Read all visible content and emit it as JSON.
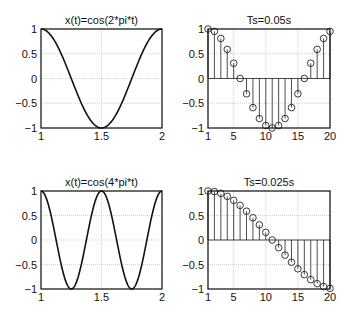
{
  "chart_data": [
    {
      "type": "line",
      "title": "x(t)=cos(2*pi*t)",
      "xlabel": "",
      "ylabel": "",
      "xlim": [
        1,
        2
      ],
      "ylim": [
        -1,
        1
      ],
      "xticks": [
        "1",
        "1.5",
        "2"
      ],
      "yticks": [
        "1",
        "0.5",
        "0",
        "−0.5",
        "−1"
      ],
      "grid": true,
      "function": "cos(2*pi*t)",
      "freq": 2
    },
    {
      "type": "stem",
      "title": "Ts=0.05s",
      "xlim": [
        1,
        20
      ],
      "ylim": [
        -1,
        1
      ],
      "xticks": [
        "1",
        "5",
        "10",
        "15",
        "20"
      ],
      "yticks": [
        "1",
        "0.5",
        "0",
        "−0.5",
        "−1"
      ],
      "grid": true,
      "x": [
        1,
        2,
        3,
        4,
        5,
        6,
        7,
        8,
        9,
        10,
        11,
        12,
        13,
        14,
        15,
        16,
        17,
        18,
        19,
        20
      ],
      "values": [
        1.0,
        0.951,
        0.809,
        0.588,
        0.309,
        0.0,
        -0.309,
        -0.588,
        -0.809,
        -0.951,
        -1.0,
        -0.951,
        -0.809,
        -0.588,
        -0.309,
        0.0,
        0.309,
        0.588,
        0.809,
        0.951
      ],
      "Ts": 0.05
    },
    {
      "type": "line",
      "title": "x(t)=cos(4*pi*t)",
      "xlim": [
        1,
        2
      ],
      "ylim": [
        -1,
        1
      ],
      "xticks": [
        "1",
        "1.5",
        "2"
      ],
      "yticks": [
        "1",
        "0.5",
        "0",
        "−0.5",
        "−1"
      ],
      "grid": true,
      "function": "cos(4*pi*t)",
      "freq": 4
    },
    {
      "type": "stem",
      "title": "Ts=0.025s",
      "xlim": [
        1,
        20
      ],
      "ylim": [
        -1,
        1
      ],
      "xticks": [
        "1",
        "5",
        "10",
        "15",
        "20"
      ],
      "yticks": [
        "1",
        "0.5",
        "0",
        "−0.5",
        "−1"
      ],
      "grid": true,
      "x": [
        1,
        2,
        3,
        4,
        5,
        6,
        7,
        8,
        9,
        10,
        11,
        12,
        13,
        14,
        15,
        16,
        17,
        18,
        19,
        20
      ],
      "values": [
        1.0,
        0.988,
        0.951,
        0.891,
        0.809,
        0.707,
        0.588,
        0.454,
        0.309,
        0.156,
        0.0,
        -0.156,
        -0.309,
        -0.454,
        -0.588,
        -0.707,
        -0.809,
        -0.891,
        -0.951,
        -0.988
      ],
      "Ts": 0.025
    }
  ],
  "panels": [
    {
      "box": [
        41,
        29,
        121,
        99
      ]
    },
    {
      "box": [
        208,
        29,
        122,
        99
      ]
    },
    {
      "box": [
        41,
        191,
        121,
        98
      ]
    },
    {
      "box": [
        208,
        191,
        122,
        98
      ]
    }
  ]
}
